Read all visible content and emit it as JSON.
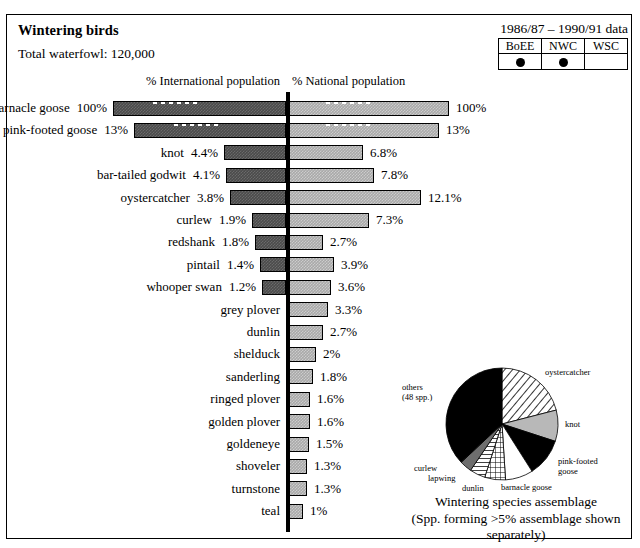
{
  "header": {
    "title": "Wintering birds",
    "total": "Total waterfowl: 120,000",
    "daterange": "1986/87 – 1990/91 data"
  },
  "survey_table": {
    "columns": [
      "BoEE",
      "NWC",
      "WSC"
    ],
    "marks": [
      "dot",
      "dot",
      ""
    ]
  },
  "axis_headers": {
    "international": "% International population",
    "national": "% National population"
  },
  "chart_data": {
    "type": "bar",
    "orientation": "horizontal-diverging",
    "title": "Wintering birds",
    "xlabel_left": "% International population",
    "xlabel_right": "% National population",
    "categories": [
      "barnacle goose",
      "pink-footed goose",
      "knot",
      "bar-tailed godwit",
      "oystercatcher",
      "curlew",
      "redshank",
      "pintail",
      "whooper swan",
      "grey plover",
      "dunlin",
      "shelduck",
      "sanderling",
      "ringed plover",
      "golden plover",
      "goldeneye",
      "shoveler",
      "turnstone",
      "teal"
    ],
    "series": [
      {
        "name": "% International population",
        "labels": [
          "100%",
          "13%",
          "4.4%",
          "4.1%",
          "3.8%",
          "1.9%",
          "1.8%",
          "1.4%",
          "1.2%",
          "",
          "",
          "",
          "",
          "",
          "",
          "",
          "",
          "",
          ""
        ],
        "values": [
          100,
          13,
          4.4,
          4.1,
          3.8,
          1.9,
          1.8,
          1.4,
          1.2,
          0,
          0,
          0,
          0,
          0,
          0,
          0,
          0,
          0,
          0
        ],
        "bar_px": [
          173,
          152,
          62,
          60,
          56,
          34,
          31,
          26,
          24,
          0,
          0,
          0,
          0,
          0,
          0,
          0,
          0,
          0,
          0
        ],
        "scale_break": [
          true,
          true,
          false,
          false,
          false,
          false,
          false,
          false,
          false,
          false,
          false,
          false,
          false,
          false,
          false,
          false,
          false,
          false,
          false
        ]
      },
      {
        "name": "% National population",
        "labels": [
          "100%",
          "13%",
          "6.8%",
          "7.8%",
          "12.1%",
          "7.3%",
          "2.7%",
          "3.9%",
          "3.6%",
          "3.3%",
          "2.7%",
          "2%",
          "1.8%",
          "1.6%",
          "1.6%",
          "1.5%",
          "1.3%",
          "1.3%",
          "1%"
        ],
        "values": [
          100,
          13,
          6.8,
          7.8,
          12.1,
          7.3,
          2.7,
          3.9,
          3.6,
          3.3,
          2.7,
          2.0,
          1.8,
          1.6,
          1.6,
          1.5,
          1.3,
          1.3,
          1.0
        ],
        "bar_px": [
          160,
          150,
          74,
          85,
          132,
          80,
          34,
          45,
          42,
          39,
          34,
          27,
          24,
          21,
          21,
          20,
          18,
          18,
          14
        ]
      }
    ],
    "grid": false,
    "legend": "none"
  },
  "pie": {
    "type": "pie",
    "title": "Wintering species assemblage",
    "subtitle": "(Spp. forming >5% assemblage shown separately)",
    "slices": [
      {
        "label": "oystercatcher",
        "value": 21.0,
        "pattern": "diagonal-hatch"
      },
      {
        "label": "knot",
        "value": 9.0,
        "pattern": "light-gray"
      },
      {
        "label": "pink-footed goose",
        "value": 11.0,
        "pattern": "solid-black"
      },
      {
        "label": "barnacle goose",
        "value": 8.0,
        "pattern": "white"
      },
      {
        "label": "dunlin",
        "value": 6.0,
        "pattern": "cross-hatch"
      },
      {
        "label": "lapwing",
        "value": 4.5,
        "pattern": "horizontal-hatch"
      },
      {
        "label": "curlew",
        "value": 3.5,
        "pattern": "mid-gray"
      },
      {
        "label": "others",
        "value": 37.0,
        "pattern": "solid-black",
        "sublabel": "(48 spp.)"
      }
    ]
  },
  "colors": {
    "bar_left": "#4b4b4b",
    "bar_right": "#a9a9a9",
    "axis": "#000000",
    "border": "#000000",
    "background": "#ffffff"
  }
}
